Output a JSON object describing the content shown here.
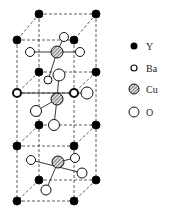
{
  "diagram": {
    "legend": [
      {
        "symbol": "Y",
        "label": "Y",
        "style": "filled-black"
      },
      {
        "symbol": "Ba",
        "label": "Ba",
        "style": "open-small"
      },
      {
        "symbol": "Cu",
        "label": "Cu",
        "style": "hatched"
      },
      {
        "symbol": "O",
        "label": "O",
        "style": "open-large"
      }
    ],
    "colors": {
      "line": "#333333",
      "atom_fill_black": "#000000",
      "hatch": "#555555"
    }
  }
}
